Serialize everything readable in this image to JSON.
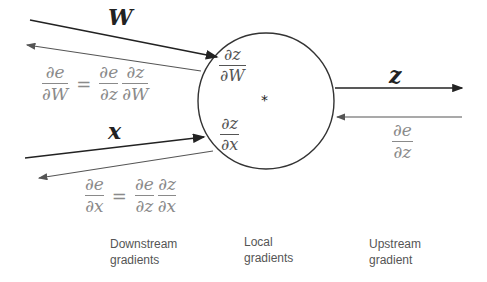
{
  "diagram": {
    "node": {
      "operation": "*"
    },
    "inputs": {
      "w": {
        "label": "W"
      },
      "x": {
        "label": "x"
      }
    },
    "output": {
      "label": "z"
    },
    "local_gradients": {
      "dz_dW": {
        "num": "∂z",
        "den": "∂W"
      },
      "dz_dx": {
        "num": "∂z",
        "den": "∂x"
      }
    },
    "upstream_gradient": {
      "num": "∂e",
      "den": "∂z"
    },
    "downstream_gradients": {
      "w": {
        "lhs": {
          "num": "∂e",
          "den": "∂W"
        },
        "equals": "=",
        "rhs1": {
          "num": "∂e",
          "den": "∂z"
        },
        "rhs2": {
          "num": "∂z",
          "den": "∂W"
        }
      },
      "x": {
        "lhs": {
          "num": "∂e",
          "den": "∂x"
        },
        "equals": "=",
        "rhs1": {
          "num": "∂e",
          "den": "∂z"
        },
        "rhs2": {
          "num": "∂z",
          "den": "∂x"
        }
      }
    },
    "captions": {
      "downstream": [
        "Downstream",
        "gradients"
      ],
      "local": [
        "Local",
        "gradients"
      ],
      "upstream": [
        "Upstream",
        "gradient"
      ]
    },
    "colors": {
      "forward": "#222222",
      "backward": "#555555",
      "text_grey": "#8a8a8a"
    }
  }
}
